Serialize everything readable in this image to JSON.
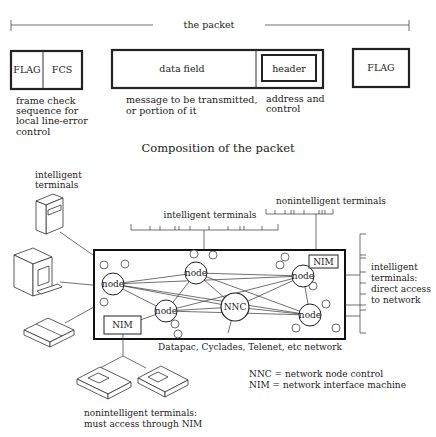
{
  "packet": {
    "span_label": "the packet",
    "fields": {
      "flag_start": "FLAG",
      "fcs": "FCS",
      "data_field": "data field",
      "header": "header",
      "flag_end": "FLAG"
    },
    "descriptions": {
      "fcs_line1": "frame check",
      "fcs_line2": "sequence for",
      "fcs_line3": "local line-error",
      "fcs_line4": "control",
      "data_line1": "message to be transmitted,",
      "data_line2": "or portion of it",
      "header_line1": "address and",
      "header_line2": "control"
    },
    "caption": "Composition of the packet"
  },
  "network": {
    "labels": {
      "intelligent_left_line1": "intelligent",
      "intelligent_left_line2": "terminals",
      "intelligent_top": "intelligent terminals",
      "nonintelligent_top": "nonintelligent terminals",
      "right_line1": "intelligent",
      "right_line2": "terminals:",
      "right_line3": "direct access",
      "right_line4": "to network",
      "network_name": "Datapac, Cyclades, Telenet, etc network",
      "bottom_line1": "nonintelligent terminals:",
      "bottom_line2": "must access through NIM"
    },
    "nodes": {
      "node_label": "node",
      "nnc_label": "NNC",
      "nim_label": "NIM"
    },
    "legend": {
      "nnc": "NNC = network node control",
      "nim": "NIM = network interface machine"
    }
  }
}
